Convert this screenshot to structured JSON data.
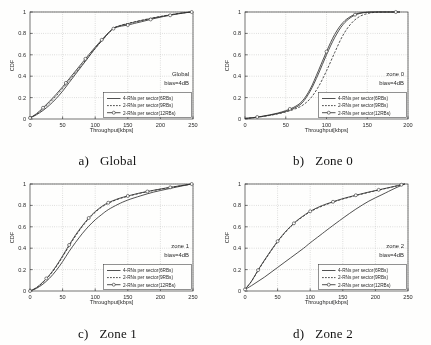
{
  "figure": {
    "series_styles": [
      "solid",
      "dashed",
      "solid-circle-markers"
    ],
    "legend_labels": [
      "4-RNs per sector(6RBs)",
      "2-RNs per sector(9RBs)",
      "2-RNs per sector(12RBs)"
    ],
    "captions": [
      {
        "letter": "a)",
        "title": "Global"
      },
      {
        "letter": "b)",
        "title": "Zone 0"
      },
      {
        "letter": "c)",
        "title": "Zone 1"
      },
      {
        "letter": "d)",
        "title": "Zone 2"
      }
    ]
  },
  "chart_data": [
    {
      "type": "line",
      "panel": "a",
      "title": "a) Global",
      "annotation": [
        "Global",
        "bias=4dB"
      ],
      "xlabel": "Throughput[kbps]",
      "ylabel": "CDF",
      "xlim": [
        0,
        250
      ],
      "ylim": [
        0,
        1
      ],
      "xticks": [
        0,
        50,
        100,
        150,
        200,
        250
      ],
      "yticks": [
        0,
        0.2,
        0.4,
        0.6,
        0.8,
        1
      ],
      "grid": true,
      "legend_position": "lower-right",
      "series": [
        {
          "name": "4-RNs per sector(6RBs)",
          "style": "solid",
          "x": [
            0,
            10,
            20,
            30,
            40,
            50,
            60,
            70,
            80,
            90,
            100,
            110,
            120,
            125,
            130,
            140,
            150,
            160,
            175,
            190,
            205,
            220,
            235,
            248
          ],
          "y": [
            0.01,
            0.04,
            0.08,
            0.13,
            0.19,
            0.26,
            0.34,
            0.42,
            0.5,
            0.58,
            0.66,
            0.73,
            0.8,
            0.83,
            0.855,
            0.875,
            0.89,
            0.905,
            0.925,
            0.945,
            0.962,
            0.978,
            0.992,
            1.0
          ]
        },
        {
          "name": "2-RNs per sector(9RBs)",
          "style": "dashed",
          "x": [
            0,
            10,
            20,
            30,
            40,
            50,
            60,
            70,
            80,
            90,
            100,
            110,
            120,
            125,
            130,
            140,
            150,
            160,
            175,
            190,
            205,
            220,
            235,
            248
          ],
          "y": [
            0.01,
            0.045,
            0.095,
            0.15,
            0.215,
            0.285,
            0.36,
            0.435,
            0.51,
            0.585,
            0.66,
            0.73,
            0.8,
            0.83,
            0.855,
            0.877,
            0.893,
            0.908,
            0.928,
            0.947,
            0.964,
            0.979,
            0.992,
            1.0
          ]
        },
        {
          "name": "2-RNs per sector(12RBs)",
          "style": "solid-circle-markers",
          "x": [
            0,
            10,
            20,
            30,
            40,
            50,
            60,
            70,
            80,
            90,
            100,
            110,
            120,
            125,
            130,
            140,
            150,
            160,
            175,
            190,
            205,
            220,
            235,
            248
          ],
          "y": [
            0.01,
            0.05,
            0.105,
            0.165,
            0.23,
            0.3,
            0.375,
            0.45,
            0.525,
            0.6,
            0.672,
            0.74,
            0.805,
            0.833,
            0.852,
            0.868,
            0.878,
            0.893,
            0.915,
            0.938,
            0.958,
            0.975,
            0.99,
            1.0
          ],
          "marker_x": [
            0,
            20,
            55,
            85,
            110,
            128,
            150,
            185,
            215,
            248
          ]
        }
      ]
    },
    {
      "type": "line",
      "panel": "b",
      "title": "b) Zone 0",
      "annotation": [
        "zone 0",
        "bias=4dB"
      ],
      "xlabel": "Throughput[kbps]",
      "ylabel": "CDF",
      "xlim": [
        0,
        200
      ],
      "ylim": [
        0,
        1
      ],
      "xticks": [
        0,
        50,
        100,
        150,
        200
      ],
      "yticks": [
        0,
        0.2,
        0.4,
        0.6,
        0.8,
        1
      ],
      "grid": true,
      "legend_position": "lower-right",
      "series": [
        {
          "name": "4-RNs per sector(6RBs)",
          "style": "solid",
          "x": [
            0,
            10,
            20,
            30,
            40,
            50,
            60,
            70,
            80,
            90,
            100,
            110,
            120,
            130,
            140,
            150,
            160,
            175,
            190
          ],
          "y": [
            0.005,
            0.012,
            0.022,
            0.035,
            0.05,
            0.07,
            0.1,
            0.15,
            0.26,
            0.42,
            0.6,
            0.76,
            0.88,
            0.95,
            0.985,
            0.997,
            1.0,
            1.0,
            1.0
          ]
        },
        {
          "name": "2-RNs per sector(9RBs)",
          "style": "dashed",
          "x": [
            0,
            10,
            20,
            30,
            40,
            50,
            60,
            70,
            80,
            90,
            100,
            110,
            120,
            130,
            140,
            150,
            160,
            175,
            190
          ],
          "y": [
            0.005,
            0.012,
            0.022,
            0.033,
            0.048,
            0.066,
            0.09,
            0.125,
            0.19,
            0.3,
            0.45,
            0.62,
            0.78,
            0.89,
            0.955,
            0.985,
            0.997,
            1.0,
            1.0
          ]
        },
        {
          "name": "2-RNs per sector(12RBs)",
          "style": "solid-circle-markers",
          "x": [
            0,
            10,
            20,
            30,
            40,
            50,
            60,
            70,
            80,
            90,
            100,
            110,
            120,
            130,
            140,
            150,
            160,
            175,
            190
          ],
          "y": [
            0.005,
            0.013,
            0.024,
            0.038,
            0.055,
            0.078,
            0.11,
            0.165,
            0.28,
            0.45,
            0.63,
            0.79,
            0.9,
            0.96,
            0.99,
            0.998,
            1.0,
            1.0,
            1.0
          ],
          "marker_x": [
            15,
            55,
            100,
            135,
            185
          ]
        }
      ]
    },
    {
      "type": "line",
      "panel": "c",
      "title": "c) Zone 1",
      "annotation": [
        "zone 1",
        "bias=4dB"
      ],
      "xlabel": "Throughput[kbps]",
      "ylabel": "CDF",
      "xlim": [
        0,
        250
      ],
      "ylim": [
        0,
        1
      ],
      "xticks": [
        0,
        50,
        100,
        150,
        200,
        250
      ],
      "yticks": [
        0,
        0.2,
        0.4,
        0.6,
        0.8,
        1
      ],
      "grid": true,
      "legend_position": "lower-right",
      "series": [
        {
          "name": "4-RNs per sector(6RBs)",
          "style": "solid",
          "x": [
            0,
            10,
            20,
            30,
            40,
            50,
            60,
            70,
            80,
            90,
            100,
            110,
            120,
            135,
            150,
            170,
            190,
            210,
            230,
            248
          ],
          "y": [
            0.0,
            0.025,
            0.065,
            0.12,
            0.19,
            0.275,
            0.37,
            0.455,
            0.535,
            0.605,
            0.665,
            0.715,
            0.76,
            0.81,
            0.85,
            0.89,
            0.925,
            0.952,
            0.978,
            1.0
          ]
        },
        {
          "name": "2-RNs per sector(9RBs)",
          "style": "dashed",
          "x": [
            0,
            10,
            20,
            30,
            40,
            50,
            60,
            70,
            80,
            90,
            100,
            110,
            120,
            135,
            150,
            170,
            190,
            210,
            230,
            248
          ],
          "y": [
            0.0,
            0.03,
            0.08,
            0.145,
            0.225,
            0.32,
            0.42,
            0.515,
            0.6,
            0.675,
            0.735,
            0.785,
            0.82,
            0.858,
            0.885,
            0.915,
            0.94,
            0.962,
            0.982,
            1.0
          ]
        },
        {
          "name": "2-RNs per sector(12RBs)",
          "style": "solid-circle-markers",
          "x": [
            0,
            10,
            20,
            30,
            40,
            50,
            60,
            70,
            80,
            90,
            100,
            110,
            120,
            135,
            150,
            170,
            190,
            210,
            230,
            248
          ],
          "y": [
            0.0,
            0.032,
            0.085,
            0.15,
            0.232,
            0.328,
            0.43,
            0.525,
            0.608,
            0.682,
            0.742,
            0.79,
            0.825,
            0.862,
            0.888,
            0.918,
            0.942,
            0.964,
            0.983,
            1.0
          ],
          "marker_x": [
            0,
            25,
            60,
            90,
            120,
            150,
            180,
            215,
            248
          ]
        }
      ]
    },
    {
      "type": "line",
      "panel": "d",
      "title": "d) Zone 2",
      "annotation": [
        "zone 2",
        "bias=4dB"
      ],
      "xlabel": "Throughput[kbps]",
      "ylabel": "CDF",
      "xlim": [
        0,
        250
      ],
      "ylim": [
        0,
        1
      ],
      "xticks": [
        0,
        50,
        100,
        150,
        200,
        250
      ],
      "yticks": [
        0,
        0.2,
        0.4,
        0.6,
        0.8,
        1
      ],
      "grid": true,
      "legend_position": "lower-right",
      "series": [
        {
          "name": "4-RNs per sector(6RBs)",
          "style": "solid",
          "x": [
            0,
            10,
            20,
            30,
            40,
            50,
            60,
            70,
            80,
            90,
            100,
            115,
            130,
            150,
            170,
            190,
            210,
            230,
            245
          ],
          "y": [
            0.015,
            0.05,
            0.09,
            0.13,
            0.175,
            0.22,
            0.265,
            0.31,
            0.355,
            0.4,
            0.45,
            0.52,
            0.59,
            0.68,
            0.765,
            0.84,
            0.9,
            0.96,
            1.0
          ]
        },
        {
          "name": "2-RNs per sector(9RBs)",
          "style": "dashed",
          "x": [
            0,
            10,
            20,
            30,
            40,
            50,
            60,
            70,
            80,
            90,
            100,
            115,
            130,
            150,
            170,
            190,
            210,
            230,
            245
          ],
          "y": [
            0.015,
            0.09,
            0.19,
            0.285,
            0.375,
            0.46,
            0.535,
            0.6,
            0.655,
            0.7,
            0.74,
            0.785,
            0.82,
            0.86,
            0.892,
            0.922,
            0.95,
            0.978,
            1.0
          ]
        },
        {
          "name": "2-RNs per sector(12RBs)",
          "style": "solid-circle-markers",
          "x": [
            0,
            10,
            20,
            30,
            40,
            50,
            60,
            70,
            80,
            90,
            100,
            115,
            130,
            150,
            170,
            190,
            210,
            230,
            245
          ],
          "y": [
            0.015,
            0.092,
            0.195,
            0.29,
            0.38,
            0.465,
            0.54,
            0.605,
            0.66,
            0.705,
            0.745,
            0.79,
            0.824,
            0.863,
            0.895,
            0.925,
            0.952,
            0.979,
            1.0
          ],
          "marker_x": [
            0,
            20,
            50,
            75,
            100,
            135,
            170,
            205,
            240
          ]
        }
      ]
    }
  ]
}
